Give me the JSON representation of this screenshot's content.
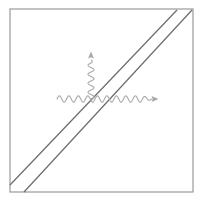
{
  "figure": {
    "title": "",
    "caption": "",
    "background_color": "#ffffff",
    "canvas": {
      "width": 206,
      "height": 203
    },
    "border_frame": {
      "name": "square-frame",
      "color": "#9a9a9a",
      "stroke_width": 1.2,
      "left": 10,
      "top": 9,
      "right": 193,
      "bottom": 192
    },
    "diagonals": {
      "color": "#6b6b6b",
      "stroke_width": 1.2,
      "lines": [
        {
          "label": "upper-left-diagonal",
          "x1": 10,
          "y1": 185,
          "x2": 177,
          "y2": 10
        },
        {
          "label": "lower-right-diagonal",
          "x1": 24,
          "y1": 192,
          "x2": 192,
          "y2": 10
        }
      ]
    },
    "wavy_lines": {
      "color": "#a8a8a8",
      "stroke_width": 1.1,
      "vertex": {
        "x": 91,
        "y": 99
      },
      "items": [
        {
          "label": "horizontal-wavy-line",
          "orientation": "horizontal",
          "x_start": 57,
          "x_end": 152,
          "y": 99,
          "amplitude": 3.2,
          "wavelength": 9.5,
          "arrow": "right"
        },
        {
          "label": "vertical-wavy-line",
          "orientation": "vertical",
          "y_start": 99,
          "y_end": 60,
          "x": 91,
          "amplitude": 3.0,
          "wavelength": 9.0,
          "arrow": "up"
        }
      ]
    },
    "arrowheads": [
      {
        "name": "right-arrowhead",
        "x": 152,
        "y": 99,
        "direction": "right",
        "color": "#a8a8a8"
      },
      {
        "name": "up-arrowhead",
        "x": 91,
        "y": 58,
        "direction": "up",
        "color": "#a8a8a8"
      }
    ]
  }
}
